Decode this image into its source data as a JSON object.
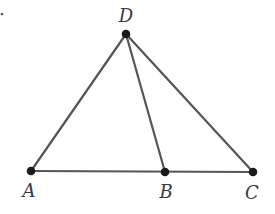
{
  "diagram": {
    "type": "geometry",
    "colors": {
      "line": "#555555",
      "point": "#1a1a1a",
      "label": "#3a3a3a",
      "background": "#ffffff"
    },
    "points": [
      {
        "id": "A",
        "label": "A",
        "x": 31,
        "y": 171,
        "label_x": 29,
        "label_y": 197
      },
      {
        "id": "B",
        "label": "B",
        "x": 165,
        "y": 172,
        "label_x": 166,
        "label_y": 198
      },
      {
        "id": "C",
        "label": "C",
        "x": 253,
        "y": 172,
        "label_x": 252,
        "label_y": 199
      },
      {
        "id": "D",
        "label": "D",
        "x": 126,
        "y": 34,
        "label_x": 126,
        "label_y": 22
      }
    ],
    "segments": [
      {
        "from": "A",
        "to": "D"
      },
      {
        "from": "D",
        "to": "B"
      },
      {
        "from": "D",
        "to": "C"
      },
      {
        "from": "A",
        "to": "C"
      }
    ],
    "stray_mark": {
      "x": 2,
      "y": 14
    }
  }
}
